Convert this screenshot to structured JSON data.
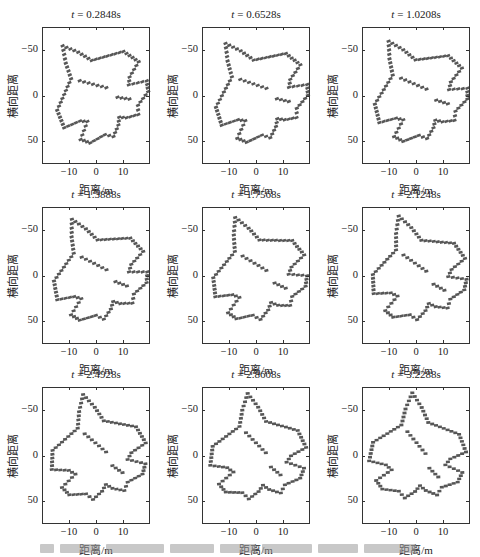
{
  "chart_data": {
    "type": "scatter",
    "layout": {
      "rows": 3,
      "cols": 3,
      "grid": false,
      "legend": "none"
    },
    "xlabel": "距离/m",
    "ylabel": "横向距离",
    "xlim": [
      -20,
      20
    ],
    "ylim": [
      75,
      -75
    ],
    "xticks": [
      -10,
      0,
      10
    ],
    "yticks": [
      -50,
      0,
      50
    ],
    "ytick_labels": [
      "−50",
      "0",
      "50"
    ],
    "xtick_labels": [
      "−10",
      "0",
      "10"
    ],
    "panels": [
      {
        "title_var": "t",
        "title_value": "0.2848s",
        "rotation_deg": -40
      },
      {
        "title_var": "t",
        "title_value": "0.6528s",
        "rotation_deg": -36
      },
      {
        "title_var": "t",
        "title_value": "1.0208s",
        "rotation_deg": -32
      },
      {
        "title_var": "t",
        "title_value": "1.3888s",
        "rotation_deg": -28
      },
      {
        "title_var": "t",
        "title_value": "1.7568s",
        "rotation_deg": -24
      },
      {
        "title_var": "t",
        "title_value": "2.1248s",
        "rotation_deg": -20
      },
      {
        "title_var": "t",
        "title_value": "2.4928s",
        "rotation_deg": -15
      },
      {
        "title_var": "t",
        "title_value": "2.8608s",
        "rotation_deg": -10
      },
      {
        "title_var": "t",
        "title_value": "3.2288s",
        "rotation_deg": -5
      }
    ]
  }
}
